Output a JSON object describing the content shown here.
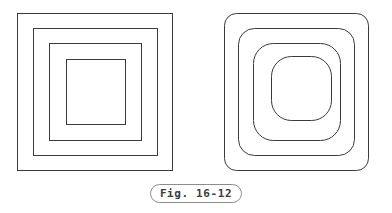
{
  "figure": {
    "caption": "Fig. 16-12",
    "stroke_color": "#3a3a3a",
    "caption_border_color": "#8c8c8c",
    "caption_text_color": "#3c3c3c",
    "background_color": "#ffffff",
    "stroke_width": 1,
    "panels": [
      {
        "id": "left-panel",
        "name": "nested-squares-sharp",
        "description": "Four nested squares with sharp (square) corners",
        "corner_style": "sharp",
        "shape_count": 4,
        "shapes": [
          {
            "index": 1,
            "x": 17,
            "y": 13,
            "width": 155,
            "height": 157,
            "corner_radius": 0
          },
          {
            "index": 2,
            "x": 33,
            "y": 28,
            "width": 124,
            "height": 127,
            "corner_radius": 0
          },
          {
            "index": 3,
            "x": 49,
            "y": 43,
            "width": 92,
            "height": 97,
            "corner_radius": 0
          },
          {
            "index": 4,
            "x": 66,
            "y": 59,
            "width": 59,
            "height": 65,
            "corner_radius": 0
          }
        ]
      },
      {
        "id": "right-panel",
        "name": "nested-squares-rounded",
        "description": "Four nested squares with progressively larger rounded corners toward the center",
        "corner_style": "rounded",
        "shape_count": 4,
        "shapes": [
          {
            "index": 1,
            "x": 224,
            "y": 13,
            "width": 144,
            "height": 157,
            "corner_radius": 12
          },
          {
            "index": 2,
            "x": 238,
            "y": 28,
            "width": 116,
            "height": 127,
            "corner_radius": 16
          },
          {
            "index": 3,
            "x": 253,
            "y": 43,
            "width": 87,
            "height": 97,
            "corner_radius": 20
          },
          {
            "index": 4,
            "x": 271,
            "y": 56,
            "width": 60,
            "height": 64,
            "corner_radius": 20
          }
        ]
      }
    ]
  }
}
